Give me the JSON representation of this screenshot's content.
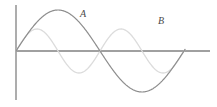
{
  "figure": {
    "name": "two-sine-waves-diagram",
    "width": 217,
    "height": 107,
    "background_color": "#ffffff"
  },
  "axes": {
    "x_axis": {
      "label": "",
      "color": "#808080",
      "origin_px": {
        "x": 16,
        "y": 51
      },
      "end_px": {
        "x": 210,
        "y": 51
      },
      "stroke_width": 1.4
    },
    "y_axis": {
      "label": "",
      "color": "#8a8a8a",
      "top_px": {
        "x": 16,
        "y": 5
      },
      "bottom_px": {
        "x": 16,
        "y": 100
      },
      "stroke_width": 1.4
    }
  },
  "labels": {
    "curve_a": "A",
    "curve_b": "B"
  },
  "colors": {
    "curve_a": "#8d8d8d",
    "curve_b": "#dcdcdc",
    "axis": "#808080",
    "label_text": "#4a4a4a"
  },
  "chart_data": {
    "type": "line",
    "title": "",
    "xlabel": "",
    "ylabel": "",
    "grid": false,
    "legend_position": "inline-annotations",
    "xlim": [
      0,
      200
    ],
    "ylim": [
      -50,
      50
    ],
    "annotations": [
      {
        "text": "A",
        "series": "A",
        "x_px": 80,
        "y_px": 9
      },
      {
        "text": "B",
        "series": "B",
        "x_px": 158,
        "y_px": 16
      }
    ],
    "series": [
      {
        "name": "A",
        "color": "#8d8d8d",
        "amplitude": 41,
        "period": 168,
        "phase_deg": 0,
        "x_start_px": 16,
        "x_end_px": 185,
        "description": "large-amplitude sine, one full cycle: rises to crest near x=60, zero near x=100, trough near x=142, returns to axis near x=184",
        "keypoints": [
          {
            "x_px": 16,
            "y_px": 51,
            "kind": "zero-rising"
          },
          {
            "x_px": 58,
            "y_px": 10,
            "kind": "crest"
          },
          {
            "x_px": 100,
            "y_px": 51,
            "kind": "zero-falling"
          },
          {
            "x_px": 142,
            "y_px": 93,
            "kind": "trough"
          },
          {
            "x_px": 184,
            "y_px": 51,
            "kind": "zero-rising"
          }
        ]
      },
      {
        "name": "B",
        "color": "#dcdcdc",
        "amplitude": 22,
        "period": 84,
        "phase_deg": 0,
        "x_start_px": 16,
        "x_end_px": 185,
        "description": "small-amplitude sine at double the frequency of A: trough near x=37, zero near x=58, crest near x=79, zero near x=100, trough near x=121, zero near x=142, crest near x=163, returns to axis near x=184",
        "keypoints": [
          {
            "x_px": 16,
            "y_px": 51,
            "kind": "zero-falling"
          },
          {
            "x_px": 37,
            "y_px": 73,
            "kind": "trough"
          },
          {
            "x_px": 58,
            "y_px": 51,
            "kind": "zero-rising"
          },
          {
            "x_px": 79,
            "y_px": 29,
            "kind": "crest"
          },
          {
            "x_px": 100,
            "y_px": 51,
            "kind": "zero-falling"
          },
          {
            "x_px": 121,
            "y_px": 73,
            "kind": "trough"
          },
          {
            "x_px": 142,
            "y_px": 51,
            "kind": "zero-rising"
          },
          {
            "x_px": 163,
            "y_px": 29,
            "kind": "crest"
          },
          {
            "x_px": 184,
            "y_px": 51,
            "kind": "zero-falling"
          }
        ]
      }
    ]
  }
}
